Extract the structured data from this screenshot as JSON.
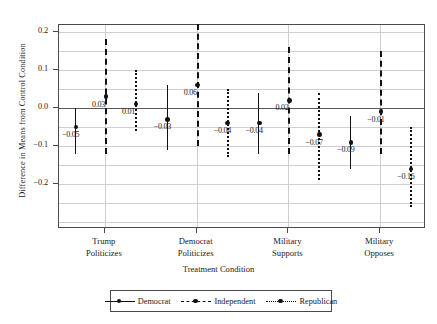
{
  "chart_data": {
    "type": "scatter",
    "title": "",
    "xlabel": "Treatment Condition",
    "ylabel": "Difference in Means from Control Condition",
    "ylim": [
      -0.318,
      0.218
    ],
    "yticks": [
      0.2,
      0.1,
      0.0,
      -0.1,
      -0.2
    ],
    "ytick_labels": [
      "0.2",
      "0.1",
      "0.0",
      "−0.1",
      "−0.2"
    ],
    "grid": true,
    "zero_reference_line": 0.0,
    "legend_position": "below-axes",
    "categories": [
      "Trump Politicizes",
      "Democrat Politicizes",
      "Military Supports",
      "Military Opposes"
    ],
    "category_lines": [
      [
        "Trump",
        "Politicizes"
      ],
      [
        "Democrat",
        "Politicizes"
      ],
      [
        "Military",
        "Supports"
      ],
      [
        "Military",
        "Opposes"
      ]
    ],
    "series": [
      {
        "name": "Democrat",
        "line_style": "solid",
        "values": [
          -0.05,
          -0.03,
          -0.04,
          -0.09
        ],
        "labels": [
          "−0.05",
          "−0.03",
          "−0.04",
          "−0.09"
        ],
        "ci_low": [
          -0.12,
          -0.11,
          -0.12,
          -0.16
        ],
        "ci_high": [
          0.0,
          0.06,
          0.04,
          -0.02
        ]
      },
      {
        "name": "Independent",
        "line_style": "dashed",
        "values": [
          0.03,
          0.06,
          0.02,
          -0.01
        ],
        "labels": [
          "0.03",
          "0.06",
          "0.02",
          "−0.01"
        ],
        "ci_low": [
          -0.12,
          -0.1,
          -0.12,
          -0.12
        ],
        "ci_high": [
          0.18,
          0.22,
          0.16,
          0.15
        ]
      },
      {
        "name": "Republican",
        "line_style": "dotted",
        "values": [
          0.01,
          -0.04,
          -0.07,
          -0.16
        ],
        "labels": [
          "0.01",
          "−0.04",
          "−0.07",
          "−0.16"
        ],
        "ci_low": [
          -0.06,
          -0.13,
          -0.19,
          -0.26
        ],
        "ci_high": [
          0.1,
          0.05,
          0.04,
          -0.05
        ]
      }
    ]
  },
  "legend": {
    "items": [
      {
        "label": "Democrat",
        "key": "legend-key-democrat"
      },
      {
        "label": "Independent",
        "key": "legend-key-independent"
      },
      {
        "label": "Republican",
        "key": "legend-key-republican"
      }
    ]
  }
}
